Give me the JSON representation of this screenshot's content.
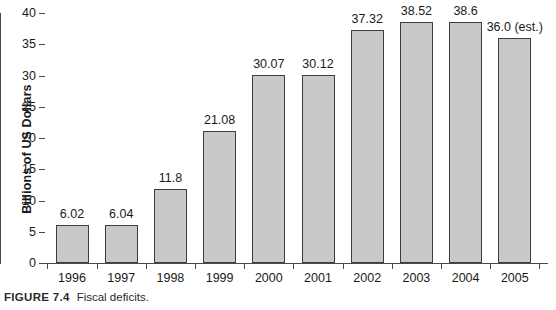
{
  "chart_data": {
    "type": "bar",
    "title": "",
    "subtitle": "",
    "xlabel": "",
    "ylabel": "Billions of US Dollars",
    "categories": [
      "1996",
      "1997",
      "1998",
      "1999",
      "2000",
      "2001",
      "2002",
      "2003",
      "2004",
      "2005"
    ],
    "values": [
      6.02,
      6.04,
      11.8,
      21.08,
      30.07,
      30.12,
      37.32,
      38.52,
      38.6,
      36.0
    ],
    "data_labels": [
      "6.02",
      "6.04",
      "11.8",
      "21.08",
      "30.07",
      "30.12",
      "37.32",
      "38.52",
      "38.6",
      "36.0 (est.)"
    ],
    "ylim": [
      0,
      40
    ],
    "ytick_values": [
      0,
      5,
      10,
      15,
      20,
      25,
      30,
      35,
      40
    ],
    "ytick_labels": [
      "0",
      "5",
      "10",
      "15",
      "20",
      "25",
      "30",
      "35",
      "40"
    ],
    "grid": false,
    "legend": null,
    "legend_position": "none",
    "series": [
      {
        "name": "Fiscal deficits",
        "values": [
          6.02,
          6.04,
          11.8,
          21.08,
          30.07,
          30.12,
          37.32,
          38.52,
          38.6,
          36.0
        ]
      }
    ],
    "annotations": [
      "2005 value is an estimate"
    ],
    "colors": {
      "bar_fill": "#c9c9c9",
      "bar_stroke": "#3d3d3d",
      "axis": "#4a4a4a",
      "text": "#1a1a1a",
      "background": "#ffffff"
    }
  },
  "caption": {
    "label": "FIGURE 7.4",
    "text": "Fiscal deficits."
  }
}
